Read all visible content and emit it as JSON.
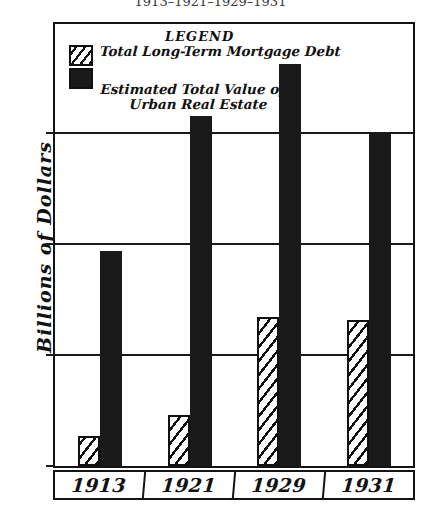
{
  "chart_data": {
    "type": "bar",
    "title": "1913–1921–1929–1931",
    "xlabel": "",
    "ylabel": "Billions of Dollars",
    "categories": [
      "1913",
      "1921",
      "1929",
      "1931"
    ],
    "ylim": [
      0,
      80
    ],
    "yticks": [
      0,
      20,
      40,
      60,
      80
    ],
    "ytick_labels": [
      "0",
      "20",
      "40",
      "60",
      "80"
    ],
    "grid": true,
    "legend_position": "upper-left-inside",
    "legend_title": "LEGEND",
    "series": [
      {
        "name": "Total Long-Term Mortgage Debt",
        "pattern": "diagonal-hatch",
        "color": "#111111",
        "values": [
          5.5,
          9.2,
          27.0,
          26.5
        ]
      },
      {
        "name": "Estimated Total Value of Urban Real Estate",
        "name_line1": "Estimated Total Value of",
        "name_line2": "Urban Real Estate",
        "pattern": "solid",
        "color": "#1a1a1a",
        "values": [
          39.0,
          63.5,
          73.0,
          60.5
        ]
      }
    ]
  },
  "colors": {
    "ink": "#111111",
    "fill_solid": "#1a1a1a",
    "background": "#ffffff",
    "title_gray": "#3a3a3a"
  }
}
